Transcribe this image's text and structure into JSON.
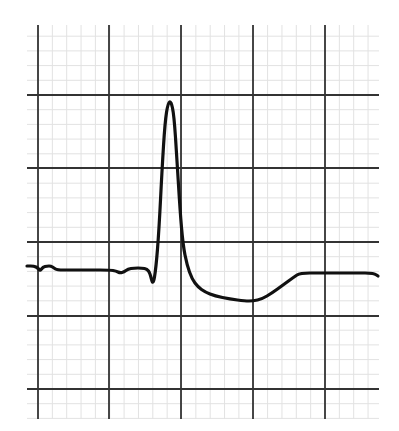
{
  "chart_data": {
    "type": "line",
    "title": "",
    "subtitle": "",
    "xlabel": "",
    "ylabel": "",
    "grid": {
      "on": true,
      "major_color": "#333333",
      "minor_color": "#e2e2e2",
      "major_x_px": [
        38,
        109,
        181,
        253,
        325
      ],
      "major_y_px": [
        95,
        168,
        242,
        316,
        389
      ],
      "minor_per_major": 5,
      "area_px": {
        "left": 27,
        "top": 25,
        "right": 379,
        "bottom": 419
      }
    },
    "trace_color": "#111111",
    "series": [
      {
        "name": "waveform",
        "points_px": [
          [
            27,
            266
          ],
          [
            34,
            266
          ],
          [
            38,
            268
          ],
          [
            40,
            271
          ],
          [
            43,
            267
          ],
          [
            47,
            266
          ],
          [
            51,
            266
          ],
          [
            54,
            268
          ],
          [
            57,
            270
          ],
          [
            70,
            270
          ],
          [
            90,
            270
          ],
          [
            110,
            270
          ],
          [
            116,
            271
          ],
          [
            120,
            273
          ],
          [
            124,
            272
          ],
          [
            128,
            269
          ],
          [
            134,
            268
          ],
          [
            142,
            268
          ],
          [
            147,
            269
          ],
          [
            150,
            273
          ],
          [
            153,
            286
          ],
          [
            156,
            268
          ],
          [
            159,
            230
          ],
          [
            162,
            170
          ],
          [
            165,
            122
          ],
          [
            168,
            103
          ],
          [
            171,
            101
          ],
          [
            174,
            115
          ],
          [
            177,
            160
          ],
          [
            180,
            210
          ],
          [
            183,
            245
          ],
          [
            187,
            265
          ],
          [
            192,
            279
          ],
          [
            198,
            287
          ],
          [
            205,
            292
          ],
          [
            215,
            296
          ],
          [
            230,
            299
          ],
          [
            245,
            301
          ],
          [
            253,
            301
          ],
          [
            262,
            299
          ],
          [
            272,
            293
          ],
          [
            283,
            285
          ],
          [
            294,
            277
          ],
          [
            300,
            273
          ],
          [
            320,
            273
          ],
          [
            340,
            273
          ],
          [
            360,
            273
          ],
          [
            370,
            273
          ],
          [
            375,
            274
          ],
          [
            378,
            276
          ]
        ]
      }
    ],
    "axis_ranges_px": {
      "x": [
        27,
        379
      ],
      "y": [
        25,
        419
      ]
    },
    "legend": null
  }
}
